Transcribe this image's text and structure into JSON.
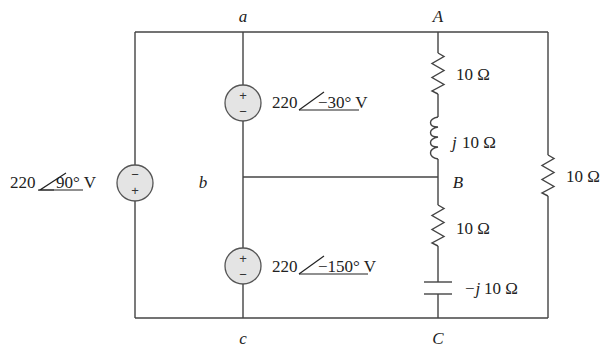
{
  "diagram": {
    "type": "AC circuit schematic",
    "nodes": {
      "a": "a",
      "b": "b",
      "c": "c",
      "A": "A",
      "B": "B",
      "C": "C"
    },
    "sources": [
      {
        "id": "v_left",
        "magnitude": "220",
        "angle": "90° V",
        "polarity_top": "−",
        "polarity_bottom": "+",
        "between": "top rail – bottom rail"
      },
      {
        "id": "v_ab",
        "magnitude": "220",
        "angle": "−30° V",
        "polarity_top": "+",
        "polarity_bottom": "−",
        "between": "a – b"
      },
      {
        "id": "v_bc",
        "magnitude": "220",
        "angle": "−150° V",
        "polarity_top": "+",
        "polarity_bottom": "−",
        "between": "b – c"
      }
    ],
    "impedances": [
      {
        "id": "r_AB",
        "type": "resistor",
        "label": "10 Ω",
        "between": "A – B"
      },
      {
        "id": "l_AB",
        "type": "inductor",
        "label_j": "j",
        "label_val": "10 Ω",
        "between": "A – B"
      },
      {
        "id": "r_BC",
        "type": "resistor",
        "label": "10 Ω",
        "between": "B – C"
      },
      {
        "id": "c_BC",
        "type": "capacitor",
        "label_j": "−j",
        "label_val": "10 Ω",
        "between": "B – C"
      },
      {
        "id": "r_AC",
        "type": "resistor",
        "label": "10 Ω",
        "between": "A – C"
      }
    ]
  }
}
